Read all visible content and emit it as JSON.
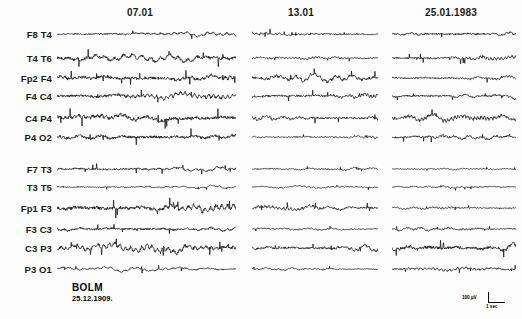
{
  "chart_data": {
    "type": "line",
    "title": "",
    "subtitle": "",
    "xlabel": "",
    "ylabel": "",
    "grid": false,
    "legend": "none",
    "columns": [
      {
        "label": "07.01",
        "x_start": 57,
        "x_end": 236
      },
      {
        "label": "13.01",
        "x_start": 252,
        "x_end": 378
      },
      {
        "label": "25.01.1983",
        "x_start": 392,
        "x_end": 516
      }
    ],
    "channels": [
      {
        "label": "F8 T4",
        "y": 34,
        "group": "right"
      },
      {
        "label": "T4 T6",
        "y": 58,
        "group": "right"
      },
      {
        "label": "Fp2 F4",
        "y": 78,
        "group": "right"
      },
      {
        "label": "F4 C4",
        "y": 96,
        "group": "right"
      },
      {
        "label": "C4 P4",
        "y": 118,
        "group": "right"
      },
      {
        "label": "P4 O2",
        "y": 137,
        "group": "right"
      },
      {
        "label": "F7 T3",
        "y": 169,
        "group": "left"
      },
      {
        "label": "T3 T5",
        "y": 187,
        "group": "left"
      },
      {
        "label": "Fp1 F3",
        "y": 208,
        "group": "left"
      },
      {
        "label": "F3 C3",
        "y": 229,
        "group": "left"
      },
      {
        "label": "C3 P3",
        "y": 248,
        "group": "left"
      },
      {
        "label": "P3 O1",
        "y": 269,
        "group": "left"
      }
    ],
    "amplitudes": [
      [
        2.6,
        2.2,
        3.0
      ],
      [
        5.0,
        1.9,
        2.8
      ],
      [
        4.6,
        4.2,
        2.4
      ],
      [
        4.2,
        3.4,
        2.6
      ],
      [
        5.2,
        3.0,
        4.6
      ],
      [
        4.4,
        1.7,
        2.9
      ],
      [
        2.9,
        1.5,
        1.3
      ],
      [
        1.6,
        1.3,
        1.5
      ],
      [
        5.4,
        3.2,
        1.7
      ],
      [
        3.2,
        1.6,
        2.0
      ],
      [
        5.0,
        3.4,
        5.2
      ],
      [
        2.2,
        1.6,
        2.4
      ]
    ],
    "ylim": [
      -8,
      8
    ],
    "xlim": [
      0,
      1
    ]
  },
  "header": {
    "columns": [
      "07.01",
      "13.01",
      "25.01.1983"
    ]
  },
  "channels": {
    "labels": [
      "F8 T4",
      "T4 T6",
      "Fp2 F4",
      "F4 C4",
      "C4 P4",
      "P4 O2",
      "F7 T3",
      "T3 T5",
      "Fp1 F3",
      "F3 C3",
      "C3 P3",
      "P3 O1"
    ]
  },
  "patient": {
    "name": "BOLM",
    "birth_date": "25.12.1909."
  },
  "calibration": {
    "amplitude": "100 µV",
    "duration": "1 sec"
  },
  "colors": {
    "trace": "#111111",
    "text": "#1a1a1a",
    "background": "#fdfdfd"
  }
}
